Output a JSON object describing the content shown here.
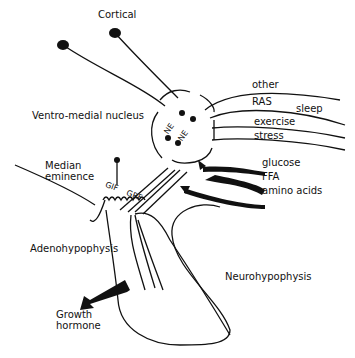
{
  "diagram": {
    "labels": {
      "cortical": "Cortical",
      "vmn": "Ventro-medial nucleus",
      "median_eminence_1": "Median",
      "median_eminence_2": "eminence",
      "adenohypophysis": "Adenohypophysis",
      "neurohypophysis": "Neurohypophysis",
      "gh_1": "Growth",
      "gh_2": "hormone",
      "gif": "GIF",
      "grf": "GRF",
      "ne1": "NE",
      "ne2": "NE"
    },
    "inputs": [
      "other",
      "RAS",
      "sleep",
      "exercise",
      "stress"
    ],
    "metabolic": [
      "glucose",
      "FFA",
      "amino acids"
    ]
  }
}
